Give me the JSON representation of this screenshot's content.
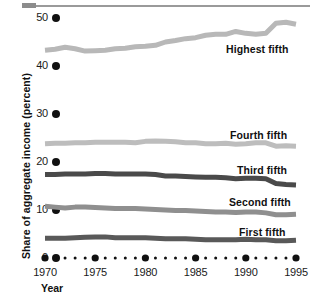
{
  "chart_data": {
    "type": "line",
    "title": "",
    "xlabel": "Year",
    "ylabel": "Share of aggregate income (percent)",
    "xlim": [
      1970,
      1995
    ],
    "ylim": [
      0,
      50
    ],
    "grid": false,
    "legend_position": "inline-right",
    "x_tick_labels": [
      "1970",
      "1975",
      "1980",
      "1985",
      "1990",
      "1995"
    ],
    "x_tick_values": [
      1970,
      1975,
      1980,
      1985,
      1990,
      1995
    ],
    "y_tick_labels": [
      "0",
      "10",
      "20",
      "30",
      "40",
      "50"
    ],
    "y_tick_values": [
      0,
      10,
      20,
      30,
      40,
      50
    ],
    "x": [
      1970,
      1971,
      1972,
      1973,
      1974,
      1975,
      1976,
      1977,
      1978,
      1979,
      1980,
      1981,
      1982,
      1983,
      1984,
      1985,
      1986,
      1987,
      1988,
      1989,
      1990,
      1991,
      1992,
      1993,
      1994,
      1995
    ],
    "series": [
      {
        "name": "Highest fifth",
        "color": "#b8b8b8",
        "values": [
          43.3,
          43.5,
          43.9,
          43.6,
          43.1,
          43.2,
          43.3,
          43.6,
          43.7,
          44.0,
          44.1,
          44.3,
          45.0,
          45.3,
          45.7,
          45.9,
          46.4,
          46.6,
          46.6,
          47.2,
          46.8,
          46.6,
          46.8,
          48.9,
          49.1,
          48.7
        ]
      },
      {
        "name": "Fourth fifth",
        "color": "#bdbdbd",
        "values": [
          23.8,
          23.9,
          23.9,
          24.0,
          24.0,
          24.1,
          24.1,
          24.1,
          24.1,
          24.0,
          24.3,
          24.4,
          24.3,
          24.2,
          24.0,
          24.0,
          23.8,
          23.8,
          23.9,
          23.7,
          23.8,
          24.0,
          24.0,
          23.3,
          23.4,
          23.3
        ]
      },
      {
        "name": "Third fifth",
        "color": "#4a4a4a",
        "values": [
          17.4,
          17.4,
          17.5,
          17.5,
          17.5,
          17.6,
          17.6,
          17.5,
          17.5,
          17.5,
          17.5,
          17.4,
          17.1,
          17.1,
          17.0,
          16.9,
          16.8,
          16.8,
          16.7,
          16.5,
          16.6,
          16.6,
          16.5,
          15.5,
          15.3,
          15.2
        ]
      },
      {
        "name": "Second fifth",
        "color": "#8f8f8f",
        "values": [
          10.8,
          10.6,
          10.4,
          10.6,
          10.6,
          10.5,
          10.4,
          10.3,
          10.3,
          10.3,
          10.2,
          10.1,
          10.0,
          9.9,
          9.9,
          9.8,
          9.7,
          9.6,
          9.6,
          9.5,
          9.6,
          9.6,
          9.4,
          9.0,
          9.0,
          9.1
        ]
      },
      {
        "name": "First fifth",
        "color": "#595959",
        "values": [
          4.1,
          4.1,
          4.1,
          4.2,
          4.3,
          4.4,
          4.4,
          4.2,
          4.2,
          4.2,
          4.2,
          4.1,
          4.0,
          4.0,
          4.0,
          3.9,
          3.8,
          3.8,
          3.8,
          3.8,
          3.9,
          3.8,
          3.8,
          3.6,
          3.6,
          3.7
        ]
      }
    ],
    "series_label_positions": [
      {
        "name": "Highest fifth",
        "left": 226,
        "top": 43
      },
      {
        "name": "Fourth fifth",
        "left": 230,
        "top": 129
      },
      {
        "name": "Third fifth",
        "left": 237,
        "top": 164
      },
      {
        "name": "Second fifth",
        "left": 229,
        "top": 196
      },
      {
        "name": "First fifth",
        "left": 239,
        "top": 226
      }
    ]
  },
  "axis": {
    "y_label": "Share of aggregate income (percent)",
    "x_label": "Year"
  },
  "colors": {
    "text": "#111111",
    "rule": "#9a9a9a",
    "axis_dot": "#111111",
    "background": "#ffffff"
  }
}
